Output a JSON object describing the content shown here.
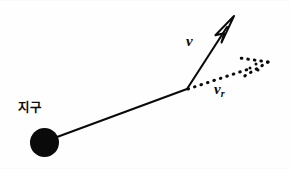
{
  "figure": {
    "kind": "physics-vector-diagram",
    "width": 290,
    "height": 173,
    "background_color": "#fefefe",
    "ink_color": "#0a0a0a"
  },
  "labels": {
    "earth": "지구",
    "velocity": "v",
    "radial_velocity_base": "v",
    "radial_velocity_subscript": "r"
  },
  "body": {
    "name": "earth-body",
    "shape": "filled-circle",
    "center_x": 44.5,
    "center_y": 142.5,
    "radius": 14.5,
    "fill": "#0a0a0a"
  },
  "geometry": {
    "vertex_x": 187,
    "vertex_y": 89,
    "radius_line": {
      "from_x": 57,
      "from_y": 137,
      "to_x": 187,
      "to_y": 89,
      "style": "solid",
      "stroke_width": 2.1
    },
    "velocity_vector": {
      "from_x": 187,
      "from_y": 89,
      "to_x": 234,
      "to_y": 16,
      "style": "solid",
      "stroke_width": 2.1,
      "arrowhead": "open-outline"
    },
    "radial_velocity_vector": {
      "from_x": 187,
      "from_y": 89,
      "to_x": 268,
      "to_y": 62,
      "style": "dotted",
      "stroke_width": 3.0,
      "arrowhead": "dotted"
    }
  },
  "edges": {
    "top_rule": "",
    "bottom_rule": ""
  }
}
